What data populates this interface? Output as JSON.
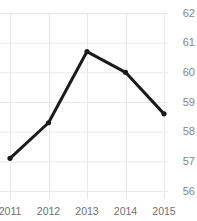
{
  "chart_data": {
    "type": "line",
    "title": "",
    "subtitle": "",
    "xlabel": "",
    "ylabel": "",
    "categories": [
      "2011",
      "2012",
      "2013",
      "2014",
      "2015"
    ],
    "x": [
      2011,
      2012,
      2013,
      2014,
      2015
    ],
    "values": [
      57.1,
      58.3,
      60.7,
      60.0,
      58.6
    ],
    "series": [
      {
        "name": "",
        "values": [
          57.1,
          58.3,
          60.7,
          60.0,
          58.6
        ]
      }
    ],
    "ylim": [
      56,
      62
    ],
    "xlim": [
      2011,
      2015
    ],
    "ytick_labels": [
      "62",
      "61",
      "60",
      "59",
      "58",
      "57",
      "56"
    ],
    "ytick_values": [
      62,
      61,
      60,
      59,
      58,
      57,
      56
    ],
    "xtick_labels": [
      "2011",
      "2012",
      "2013",
      "2014",
      "2015"
    ],
    "y_axis_position": "right",
    "grid": true,
    "grid_horizontal": true,
    "grid_vertical": true,
    "legend": false,
    "legend_position": "none",
    "markers": true,
    "colors": {
      "line": "#1a1a1a",
      "marker": "#1a1a1a",
      "grid": "#e8e8ec",
      "ytick_text": "#85858a",
      "xtick_text": "#6f6f74",
      "background": "#ffffff"
    }
  },
  "axis": {
    "y_ticks": [
      {
        "label": "62",
        "value": 62
      },
      {
        "label": "61",
        "value": 61
      },
      {
        "label": "60",
        "value": 60
      },
      {
        "label": "59",
        "value": 59
      },
      {
        "label": "58",
        "value": 58
      },
      {
        "label": "57",
        "value": 57
      },
      {
        "label": "56",
        "value": 56
      }
    ],
    "x_ticks": [
      {
        "label": "2011"
      },
      {
        "label": "2012"
      },
      {
        "label": "2013"
      },
      {
        "label": "2014"
      },
      {
        "label": "2015"
      }
    ]
  }
}
